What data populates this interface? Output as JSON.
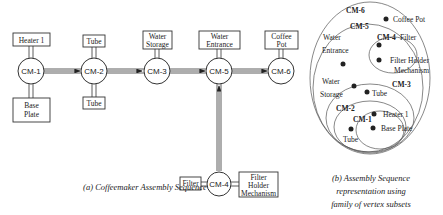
{
  "left_diagram": {
    "caption": "(a) Coffeemaker Assembly Sequence",
    "nodes": [
      "CM-1",
      "CM-2",
      "CM-3",
      "CM-5",
      "CM-6",
      "CM-4"
    ],
    "parts": {
      "heater": "Heater 1",
      "base_1": "Base",
      "base_2": "Plate",
      "tube_top": "Tube",
      "tube_bottom": "Tube",
      "water_storage_1": "Water",
      "water_storage_2": "Storage",
      "water_entrance_1": "Water",
      "water_entrance_2": "Entrance",
      "coffee_pot_1": "Coffee",
      "coffee_pot_2": "Pot",
      "filter": "Filter",
      "fhm_1": "Filter",
      "fhm_2": "Holder",
      "fhm_3": "Mechanism"
    }
  },
  "right_diagram": {
    "caption_1": "(b) Assembly Sequence",
    "caption_2": "representation using",
    "caption_3": "family of vertex subsets",
    "subsets": [
      "CM-6",
      "CM-5",
      "CM-4",
      "CM-3",
      "CM-2",
      "CM-1"
    ],
    "vertices": {
      "coffee_pot": "Coffee Pot",
      "filter": "Filter",
      "water_entrance_1": "Water",
      "water_entrance_2": "Entrance",
      "fhm_1": "Filter Holder",
      "fhm_2": "Mechanism",
      "water_storage_1": "Water",
      "water_storage_2": "Storage",
      "tube_1": "Tube",
      "heater": "Heater 1",
      "base_plate": "Base Plate",
      "tube_2": "Tube"
    }
  }
}
